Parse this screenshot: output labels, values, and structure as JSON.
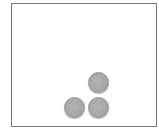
{
  "board": {
    "border_color": "#7a7a7a",
    "background": "#ffffff"
  },
  "pieces": [
    {
      "id": "piece-top",
      "cx": 98,
      "cy": 82,
      "color": "#a8a8a8"
    },
    {
      "id": "piece-bottom-left",
      "cx": 74,
      "cy": 107,
      "color": "#a8a8a8"
    },
    {
      "id": "piece-bottom-right",
      "cx": 98,
      "cy": 107,
      "color": "#a8a8a8"
    }
  ]
}
